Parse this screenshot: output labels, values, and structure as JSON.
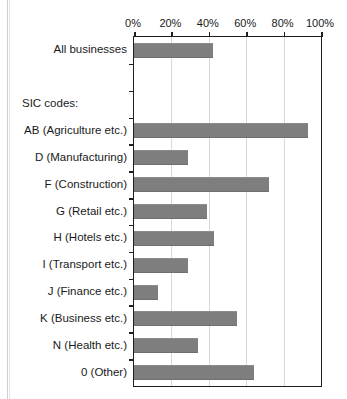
{
  "chart_data": {
    "type": "bar",
    "orientation": "horizontal",
    "title": "",
    "xlabel": "",
    "ylabel": "",
    "xlim": [
      0,
      100
    ],
    "xticks": [
      0,
      20,
      40,
      60,
      80,
      100
    ],
    "xtick_labels": [
      "0%",
      "20%",
      "40%",
      "60%",
      "80%",
      "100%"
    ],
    "grid": "vertical",
    "legend": "none",
    "bar_color": "#7e7e7e",
    "axis_color": "#1f1f1f",
    "gridline_color": "#d8d8d8",
    "group_heading": "SIC codes:",
    "categories": [
      "All businesses",
      "AB (Agriculture etc.)",
      "D (Manufacturing)",
      "F (Construction)",
      "G (Retail etc.)",
      "H (Hotels etc.)",
      "I (Transport etc.)",
      "J (Finance etc.)",
      "K (Business etc.)",
      "N (Health etc.)",
      "0 (Other)"
    ],
    "values": [
      42,
      93,
      29,
      72,
      39,
      43,
      29,
      13,
      55,
      34,
      64
    ]
  }
}
